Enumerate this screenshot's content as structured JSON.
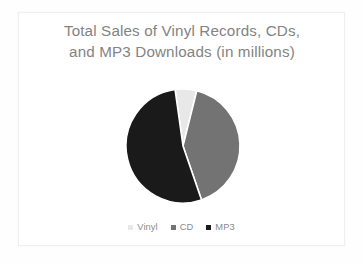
{
  "chart_data": {
    "type": "pie",
    "title": "Total Sales of Vinyl Records, CDs,\nand MP3 Downloads (in millions)",
    "title_line1": "Total Sales of Vinyl Records, CDs,",
    "title_line2": "and MP3 Downloads (in millions)",
    "xlabel": "",
    "ylabel": "",
    "units": "millions",
    "legend_position": "bottom",
    "grid": false,
    "categories": [
      "Vinyl",
      "CD",
      "MP3"
    ],
    "values": [
      6,
      41,
      53
    ],
    "value_unit": "percent",
    "slices": [
      {
        "label": "Vinyl",
        "value": 6,
        "color": "#e8e8e8",
        "start_angle": 352,
        "end_angle": 374
      },
      {
        "label": "CD",
        "value": 41,
        "color": "#737373",
        "start_angle": 374,
        "end_angle": 521
      },
      {
        "label": "MP3",
        "value": 53,
        "color": "#1a1a1a",
        "start_angle": 521,
        "end_angle": 712
      }
    ],
    "legend": [
      {
        "label": "Vinyl",
        "color": "#e8e8e8"
      },
      {
        "label": "CD",
        "color": "#737373"
      },
      {
        "label": "MP3",
        "color": "#1a1a1a"
      }
    ]
  },
  "colors": {
    "background": "#ffffff",
    "frame": "#efefef",
    "title_text": "#838383",
    "legend_text": "#8a8a8a",
    "vinyl": "#e8e8e8",
    "cd": "#737373",
    "mp3": "#1a1a1a",
    "slice_separator": "#ffffff"
  },
  "geometry": {
    "center_x": 59,
    "center_y": 60,
    "radius": 57
  }
}
